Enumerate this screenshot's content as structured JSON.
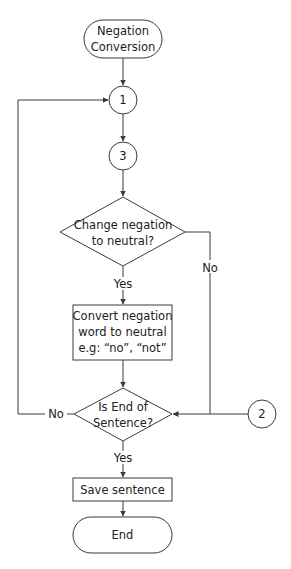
{
  "diagram": {
    "type": "flowchart",
    "nodes": {
      "start": {
        "kind": "terminator",
        "line1": "Negation",
        "line2": "Conversion"
      },
      "connector1": {
        "kind": "connector",
        "label": "1"
      },
      "connector3": {
        "kind": "connector",
        "label": "3"
      },
      "decision1": {
        "kind": "decision",
        "line1": "Change negation",
        "line2": "to neutral?"
      },
      "process1": {
        "kind": "process",
        "line1": "Convert negation",
        "line2": "word to neutral",
        "line3": "e.g: “no”, “not”"
      },
      "decision2": {
        "kind": "decision",
        "line1": "Is End of",
        "line2": "Sentence?"
      },
      "connector2": {
        "kind": "connector",
        "label": "2"
      },
      "process2": {
        "kind": "process",
        "line1": "Save sentence"
      },
      "end": {
        "kind": "terminator",
        "line1": "End"
      }
    },
    "edge_labels": {
      "decision1_yes": "Yes",
      "decision1_no": "No",
      "decision2_yes": "Yes",
      "decision2_no": "No"
    },
    "edges": [
      {
        "from": "start",
        "to": "connector1"
      },
      {
        "from": "connector1",
        "to": "connector3"
      },
      {
        "from": "connector3",
        "to": "decision1"
      },
      {
        "from": "decision1",
        "to": "process1",
        "label": "Yes"
      },
      {
        "from": "decision1",
        "to": "decision2",
        "label": "No"
      },
      {
        "from": "process1",
        "to": "decision2"
      },
      {
        "from": "connector2",
        "to": "decision2"
      },
      {
        "from": "decision2",
        "to": "connector1",
        "label": "No"
      },
      {
        "from": "decision2",
        "to": "process2",
        "label": "Yes"
      },
      {
        "from": "process2",
        "to": "end"
      }
    ],
    "colors": {
      "stroke": "#3a3a3a",
      "text": "#222222",
      "background": "#ffffff"
    }
  }
}
